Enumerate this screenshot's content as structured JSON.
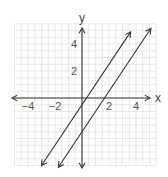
{
  "chart_data": {
    "type": "line",
    "title": "",
    "xlabel": "x",
    "ylabel": "y",
    "xlim": [
      -5,
      5.5
    ],
    "ylim": [
      -5,
      5.5
    ],
    "grid": true,
    "xticks": [
      -4,
      -2,
      2,
      4
    ],
    "yticks": [
      2,
      4
    ],
    "xtick_labels": [
      "−4",
      "−2",
      "2",
      "4"
    ],
    "ytick_labels": [
      "2",
      "4"
    ],
    "series": [
      {
        "name": "line-1",
        "equation": "y = 1.5x - 0.5",
        "slope": 1.5,
        "intercept": -0.5,
        "x_range": [
          -3,
          3.6
        ]
      },
      {
        "name": "line-2",
        "equation": "y = 1.5x - 2.5",
        "slope": 1.5,
        "intercept": -2.5,
        "x_range": [
          -1.75,
          5.1
        ]
      }
    ],
    "colors": {
      "grid": "#e2e2e2",
      "axis": "#333333",
      "line": "#333333"
    }
  }
}
